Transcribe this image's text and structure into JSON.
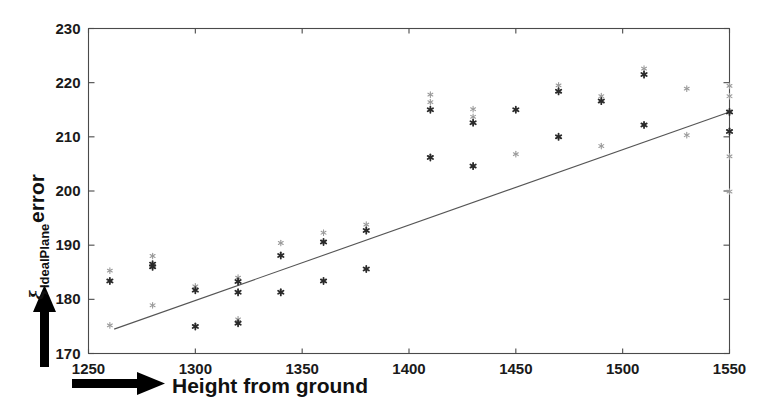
{
  "figure": {
    "background": "#ffffff",
    "axis_color": "#4a4a4a",
    "marker_color_dark": "#2a2a2a",
    "marker_color_light": "#9a9a9a",
    "fitline_color": "#555555"
  },
  "axes": {
    "x_title": "Height from ground",
    "y_title_symbol": "ξ",
    "y_title_subscript": "IdealPlane",
    "y_title_rest": " error",
    "x_ticks": [
      "1250",
      "1300",
      "1350",
      "1400",
      "1450",
      "1500",
      "1550"
    ],
    "y_ticks": [
      "230",
      "220",
      "210",
      "200",
      "190",
      "180",
      "170"
    ],
    "x_arrow_name": "x-axis-arrow",
    "y_arrow_name": "y-axis-arrow"
  },
  "chart_data": {
    "type": "scatter",
    "title": "",
    "xlabel": "Height from ground",
    "ylabel": "ξ_IdealPlane error",
    "xlim": [
      1250,
      1550
    ],
    "ylim": [
      170,
      230
    ],
    "xticks": [
      1250,
      1300,
      1350,
      1400,
      1450,
      1500,
      1550
    ],
    "yticks": [
      170,
      180,
      190,
      200,
      210,
      220,
      230
    ],
    "grid": false,
    "legend": null,
    "series": [
      {
        "name": "measurements",
        "marker": "asterisk",
        "points": [
          {
            "x": 1260,
            "y": 185.3,
            "shade": "light"
          },
          {
            "x": 1260,
            "y": 183.4,
            "shade": "dark"
          },
          {
            "x": 1260,
            "y": 175.2,
            "shade": "light"
          },
          {
            "x": 1280,
            "y": 188.0,
            "shade": "light"
          },
          {
            "x": 1280,
            "y": 186.5,
            "shade": "dark"
          },
          {
            "x": 1280,
            "y": 186.0,
            "shade": "dark"
          },
          {
            "x": 1280,
            "y": 178.9,
            "shade": "light"
          },
          {
            "x": 1300,
            "y": 182.4,
            "shade": "light"
          },
          {
            "x": 1300,
            "y": 181.7,
            "shade": "dark"
          },
          {
            "x": 1300,
            "y": 175.0,
            "shade": "dark"
          },
          {
            "x": 1320,
            "y": 184.0,
            "shade": "light"
          },
          {
            "x": 1320,
            "y": 183.3,
            "shade": "dark"
          },
          {
            "x": 1320,
            "y": 181.3,
            "shade": "dark"
          },
          {
            "x": 1320,
            "y": 176.3,
            "shade": "light"
          },
          {
            "x": 1320,
            "y": 175.6,
            "shade": "dark"
          },
          {
            "x": 1340,
            "y": 190.4,
            "shade": "light"
          },
          {
            "x": 1340,
            "y": 188.1,
            "shade": "dark"
          },
          {
            "x": 1340,
            "y": 181.3,
            "shade": "dark"
          },
          {
            "x": 1360,
            "y": 192.3,
            "shade": "light"
          },
          {
            "x": 1360,
            "y": 190.6,
            "shade": "dark"
          },
          {
            "x": 1360,
            "y": 183.4,
            "shade": "dark"
          },
          {
            "x": 1380,
            "y": 193.8,
            "shade": "light"
          },
          {
            "x": 1380,
            "y": 192.7,
            "shade": "dark"
          },
          {
            "x": 1380,
            "y": 185.6,
            "shade": "dark"
          },
          {
            "x": 1410,
            "y": 217.8,
            "shade": "light"
          },
          {
            "x": 1410,
            "y": 216.4,
            "shade": "light"
          },
          {
            "x": 1410,
            "y": 215.0,
            "shade": "dark"
          },
          {
            "x": 1410,
            "y": 206.2,
            "shade": "dark"
          },
          {
            "x": 1430,
            "y": 215.1,
            "shade": "light"
          },
          {
            "x": 1430,
            "y": 213.7,
            "shade": "light"
          },
          {
            "x": 1430,
            "y": 212.6,
            "shade": "dark"
          },
          {
            "x": 1430,
            "y": 204.6,
            "shade": "dark"
          },
          {
            "x": 1450,
            "y": 215.0,
            "shade": "dark"
          },
          {
            "x": 1450,
            "y": 206.8,
            "shade": "light"
          },
          {
            "x": 1470,
            "y": 219.5,
            "shade": "light"
          },
          {
            "x": 1470,
            "y": 218.4,
            "shade": "dark"
          },
          {
            "x": 1470,
            "y": 210.0,
            "shade": "dark"
          },
          {
            "x": 1490,
            "y": 217.5,
            "shade": "light"
          },
          {
            "x": 1490,
            "y": 216.6,
            "shade": "dark"
          },
          {
            "x": 1490,
            "y": 208.3,
            "shade": "light"
          },
          {
            "x": 1510,
            "y": 222.6,
            "shade": "light"
          },
          {
            "x": 1510,
            "y": 221.5,
            "shade": "dark"
          },
          {
            "x": 1510,
            "y": 212.2,
            "shade": "dark"
          },
          {
            "x": 1530,
            "y": 218.9,
            "shade": "light"
          },
          {
            "x": 1530,
            "y": 210.3,
            "shade": "light"
          },
          {
            "x": 1550,
            "y": 219.4,
            "shade": "light"
          },
          {
            "x": 1550,
            "y": 217.5,
            "shade": "light"
          },
          {
            "x": 1550,
            "y": 214.6,
            "shade": "dark"
          },
          {
            "x": 1550,
            "y": 211.0,
            "shade": "dark"
          },
          {
            "x": 1550,
            "y": 206.4,
            "shade": "light"
          },
          {
            "x": 1550,
            "y": 199.9,
            "shade": "light"
          }
        ]
      }
    ],
    "fit_line": {
      "name": "linear-fit",
      "x0": 1262,
      "y0": 174.5,
      "x1": 1550,
      "y1": 214.6
    }
  }
}
